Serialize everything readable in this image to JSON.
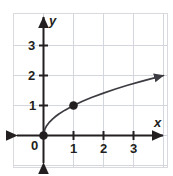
{
  "figure": {
    "background_color": "#ffffff",
    "frame_color": "#d9d9de",
    "grid_color": "#d4d6dd",
    "axis_color": "#231f20",
    "curve_color": "#3c3c42",
    "point_color": "#231f20"
  },
  "chart_data": {
    "type": "line",
    "title": "",
    "xlabel": "x",
    "ylabel": "y",
    "xlim": [
      -0.9,
      4.2
    ],
    "ylim": [
      -1.1,
      4.2
    ],
    "grid": true,
    "legend": null,
    "xticks": [
      1,
      2,
      3
    ],
    "xtick_labels": [
      "1",
      "2",
      "3"
    ],
    "yticks": [
      1,
      2,
      3
    ],
    "ytick_labels": [
      "1",
      "2",
      "3"
    ],
    "origin_label": "0",
    "series": [
      {
        "name": "y = sqrt(x)",
        "equation": "y = √x",
        "arrow_end": true,
        "x": [
          0,
          0.05,
          0.1,
          0.2,
          0.3,
          0.4,
          0.5,
          0.7,
          1.0,
          1.3,
          1.6,
          2.0,
          2.4,
          2.8,
          3.2,
          3.6,
          4.0
        ],
        "y": [
          0,
          0.224,
          0.316,
          0.447,
          0.548,
          0.632,
          0.707,
          0.837,
          1.0,
          1.14,
          1.265,
          1.414,
          1.549,
          1.673,
          1.789,
          1.897,
          2.0
        ]
      }
    ],
    "points": [
      {
        "label": "origin-point",
        "x": 0,
        "y": 0
      },
      {
        "label": "unit-point",
        "x": 1,
        "y": 1
      }
    ],
    "axis_arrows": [
      "x-positive",
      "x-negative",
      "y-positive",
      "y-negative"
    ]
  }
}
